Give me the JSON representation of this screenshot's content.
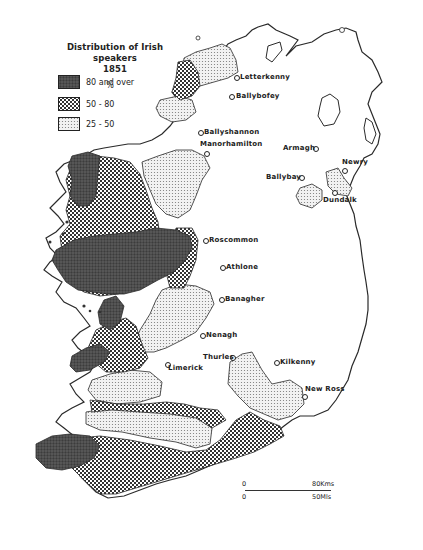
{
  "legend": {
    "title_line1": "Distribution of Irish speakers",
    "title_line2": "1851",
    "unit": "%",
    "items": [
      {
        "label": "80 and over",
        "pattern": "dark-stipple",
        "color": "#4a4a4a"
      },
      {
        "label": "50 - 80",
        "pattern": "crosshatch",
        "color": "#8c8c8c"
      },
      {
        "label": "25 - 50",
        "pattern": "light-dots",
        "color": "#e4e4e4"
      }
    ]
  },
  "towns": [
    {
      "name": "Letterkenny",
      "x": 238,
      "y": 78
    },
    {
      "name": "Ballybofey",
      "x": 233,
      "y": 97
    },
    {
      "name": "Ballyshannon",
      "x": 201,
      "y": 133
    },
    {
      "name": "Manorhamilton",
      "x": 206,
      "y": 152
    },
    {
      "name": "Armagh",
      "x": 314,
      "y": 149
    },
    {
      "name": "Ballybay",
      "x": 300,
      "y": 177
    },
    {
      "name": "Newry",
      "x": 342,
      "y": 168
    },
    {
      "name": "Dundalk",
      "x": 335,
      "y": 190
    },
    {
      "name": "Roscommon",
      "x": 204,
      "y": 240
    },
    {
      "name": "Athlone",
      "x": 221,
      "y": 267
    },
    {
      "name": "Banagher",
      "x": 220,
      "y": 298
    },
    {
      "name": "Nenagh",
      "x": 202,
      "y": 335
    },
    {
      "name": "Thurles",
      "x": 234,
      "y": 356
    },
    {
      "name": "Kilkenny",
      "x": 276,
      "y": 362
    },
    {
      "name": "Limerick",
      "x": 167,
      "y": 360
    },
    {
      "name": "New Ross",
      "x": 303,
      "y": 395
    }
  ],
  "scale_bar": {
    "km_zero": "0",
    "km_label": "80Kms",
    "mi_zero": "0",
    "mi_label": "50Mls"
  },
  "colors": {
    "outline": "#2a2a2a",
    "dark": "#4a4a4a",
    "hatch": "#7a7a7a",
    "light": "#e6e6e6",
    "background": "#ffffff"
  }
}
